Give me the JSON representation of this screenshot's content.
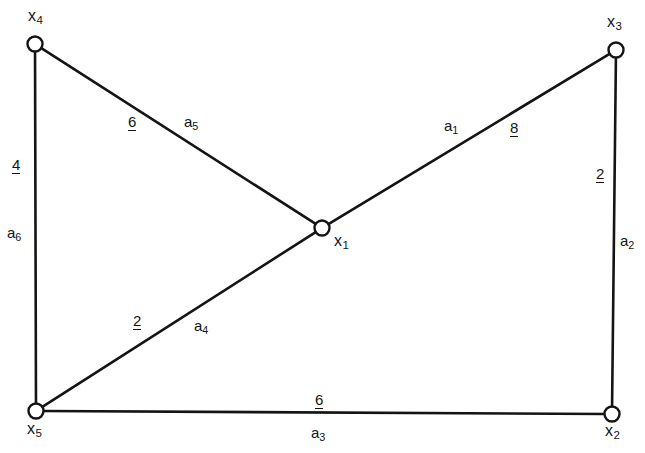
{
  "figure": {
    "type": "undirected-weighted-graph",
    "background_color": "#ffffff",
    "line_color": "#141414"
  },
  "nodes": [
    {
      "id": "x4",
      "label_base": "x",
      "label_sub": "4",
      "x": 35,
      "y": 44,
      "label_x": 28,
      "label_y": 8
    },
    {
      "id": "x3",
      "label_base": "x",
      "label_sub": "3",
      "x": 616,
      "y": 50,
      "label_x": 607,
      "label_y": 14
    },
    {
      "id": "x1",
      "label_base": "x",
      "label_sub": "1",
      "x": 322,
      "y": 228,
      "label_x": 334,
      "label_y": 233
    },
    {
      "id": "x5",
      "label_base": "x",
      "label_sub": "5",
      "x": 36,
      "y": 411,
      "label_x": 27,
      "label_y": 421
    },
    {
      "id": "x2",
      "label_base": "x",
      "label_sub": "2",
      "x": 612,
      "y": 414,
      "label_x": 605,
      "label_y": 423
    }
  ],
  "edges": [
    {
      "id": "a1",
      "name_base": "a",
      "name_sub": "1",
      "weight": "8",
      "from": "x1",
      "to": "x3",
      "name_x": 444,
      "name_y": 118,
      "weight_x": 510,
      "weight_y": 120
    },
    {
      "id": "a2",
      "name_base": "a",
      "name_sub": "2",
      "weight": "2",
      "from": "x3",
      "to": "x2",
      "name_x": 620,
      "name_y": 233,
      "weight_x": 596,
      "weight_y": 166
    },
    {
      "id": "a3",
      "name_base": "a",
      "name_sub": "3",
      "weight": "6",
      "from": "x5",
      "to": "x2",
      "name_x": 311,
      "name_y": 425,
      "weight_x": 315,
      "weight_y": 392
    },
    {
      "id": "a4",
      "name_base": "a",
      "name_sub": "4",
      "weight": "2",
      "from": "x5",
      "to": "x1",
      "name_x": 194,
      "name_y": 318,
      "weight_x": 133,
      "weight_y": 313
    },
    {
      "id": "a5",
      "name_base": "a",
      "name_sub": "5",
      "weight": "6",
      "from": "x4",
      "to": "x1",
      "name_x": 184,
      "name_y": 114,
      "weight_x": 128,
      "weight_y": 114
    },
    {
      "id": "a6",
      "name_base": "a",
      "name_sub": "6",
      "weight": "4",
      "from": "x4",
      "to": "x5",
      "name_x": 7,
      "name_y": 225,
      "weight_x": 12,
      "weight_y": 157
    }
  ]
}
